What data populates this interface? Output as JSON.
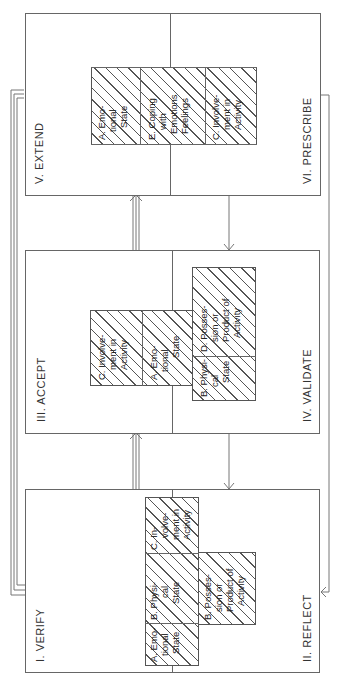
{
  "stages": {
    "verify": "I. VERIFY",
    "reflect": "II. REFLECT",
    "accept": "III. ACCEPT",
    "validate": "IV. VALIDATE",
    "extend": "V. EXTEND",
    "prescribe": "VI. PRESCRIBE"
  },
  "block1_cells": [
    {
      "lines": [
        "A. Emo-",
        "tional",
        "State"
      ]
    },
    {
      "lines": [
        "B. Physi-",
        "cal",
        "State"
      ]
    },
    {
      "lines": [
        "C. In-",
        "volve-",
        "ment in",
        "Activity"
      ]
    },
    {
      "lines": [
        "B. Posses-",
        "sion or",
        "Product of",
        "Activity"
      ]
    }
  ],
  "block2_cells": [
    {
      "lines": [
        "C. Involve-",
        "ment in",
        "Activity"
      ]
    },
    {
      "lines": [
        "A. Emo-",
        "tional",
        "State"
      ]
    },
    {
      "lines": [
        "B. Physi-",
        "cal",
        "State"
      ]
    },
    {
      "lines": [
        "D. Posses-",
        "sion or",
        "Product of",
        "Activity"
      ]
    }
  ],
  "block3_cells": [
    {
      "lines": [
        "A. Emo-",
        "tional",
        "State"
      ]
    },
    {
      "lines": [
        "E. Coping",
        "with",
        "Emotions",
        "Feelings"
      ]
    },
    {
      "lines": [
        "C. Involve-",
        "ment in",
        "Activity"
      ]
    }
  ],
  "colors": {
    "line": "#666666",
    "text": "#333333",
    "background": "#ffffff"
  }
}
